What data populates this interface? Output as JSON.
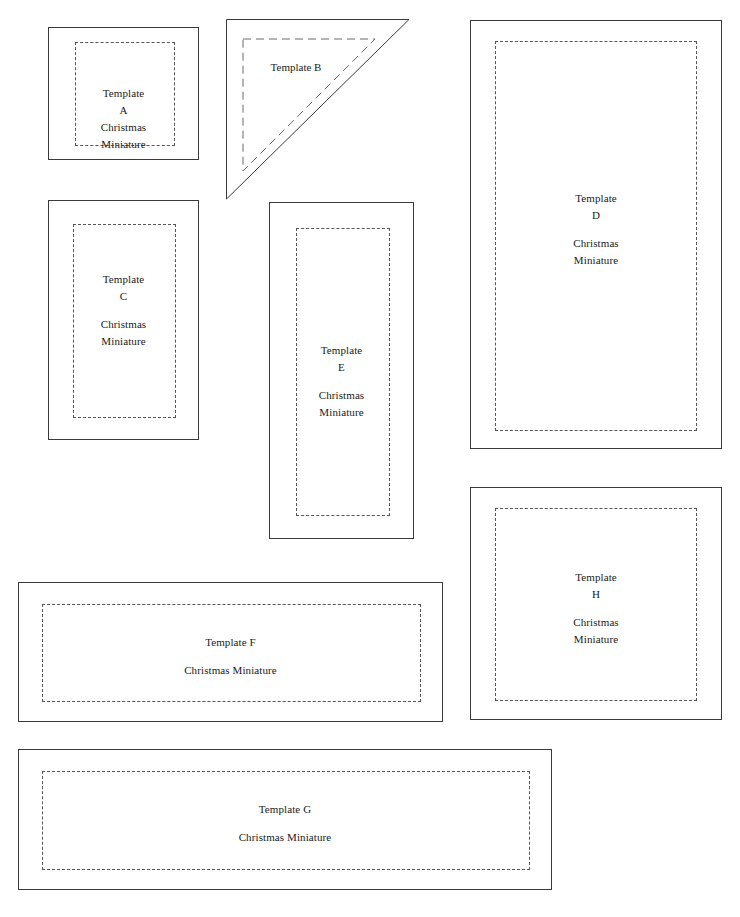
{
  "document": {
    "title": "Christmas Miniature Templates",
    "background_color": "#ffffff",
    "outline_color": "#3a3a3a",
    "seam_color": "#555555",
    "text_color": "#1a1a1a"
  },
  "common": {
    "prefix": "Template",
    "subtitle_line1": "Christmas",
    "subtitle_line2": "Miniature",
    "subtitle_single": "Christmas Miniature"
  },
  "templates": [
    {
      "id": "A",
      "shape": "rectangle",
      "name_line": "Template",
      "letter": "A",
      "sub1": "Christmas",
      "sub2": "Miniature"
    },
    {
      "id": "B",
      "shape": "right-triangle",
      "name_line": "Template",
      "letter": "B",
      "sub1": "",
      "sub2": ""
    },
    {
      "id": "C",
      "shape": "rectangle",
      "name_line": "Template",
      "letter": "C",
      "sub1": "Christmas",
      "sub2": "Miniature"
    },
    {
      "id": "D",
      "shape": "rectangle",
      "name_line": "Template",
      "letter": "D",
      "sub1": "Christmas",
      "sub2": "Miniature"
    },
    {
      "id": "E",
      "shape": "rectangle",
      "name_line": "Template",
      "letter": "E",
      "sub1": "Christmas",
      "sub2": "Miniature"
    },
    {
      "id": "F",
      "shape": "rectangle",
      "name_line": "Template F",
      "letter": "",
      "sub1": "Christmas Miniature",
      "sub2": ""
    },
    {
      "id": "G",
      "shape": "rectangle",
      "name_line": "Template G",
      "letter": "",
      "sub1": "Christmas Miniature",
      "sub2": ""
    },
    {
      "id": "H",
      "shape": "rectangle",
      "name_line": "Template",
      "letter": "H",
      "sub1": "Christmas",
      "sub2": "Miniature"
    }
  ]
}
